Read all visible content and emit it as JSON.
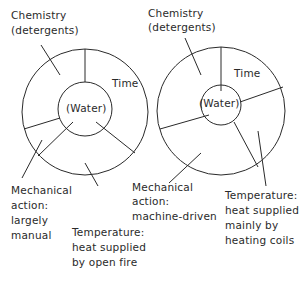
{
  "diagrams": [
    {
      "id": "left",
      "chemistry": [
        "Chemistry",
        "(detergents)"
      ],
      "time": "Time",
      "water": "(Water)",
      "mechanical": [
        "Mechanical",
        "action:",
        "largely",
        "manual"
      ],
      "temperature": [
        "Temperature:",
        "heat supplied",
        "by open fire"
      ]
    },
    {
      "id": "right",
      "chemistry": [
        "Chemistry",
        "(detergents)"
      ],
      "time": "Time",
      "water": "(Water)",
      "mechanical": [
        "Mechanical",
        "action:",
        "machine-driven"
      ],
      "temperature": [
        "Temperature:",
        "heat supplied",
        "mainly by",
        "heating coils"
      ]
    }
  ],
  "colors": {
    "ink": "#2a2a2a",
    "background": "#ffffff"
  }
}
